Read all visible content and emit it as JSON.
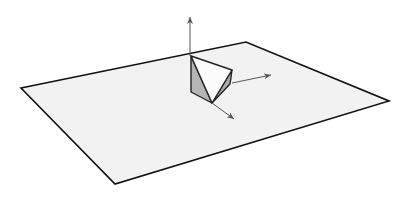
{
  "figure": {
    "colors": {
      "background": "#ffffff",
      "plane_fill": "#f2f2f2",
      "plane_edge": "#111111",
      "wedge_front_face": "#fbfbfb",
      "wedge_left_face": "#b5b5b5",
      "wedge_right_face": "#a9a9a9",
      "arrow": "#555555"
    },
    "plane": {
      "points": "21,88 246,42 389,101 115,184"
    },
    "wedge": {
      "left_face": "191,56 191,92 212,103",
      "front_face": "191,56 232,70 212,103",
      "right_face": "232,70 230,84 212,103"
    },
    "arrows": [
      {
        "name": "up-arrow",
        "x1": 190,
        "y1": 56,
        "x2": 190,
        "y2": 17
      },
      {
        "name": "right-arrow",
        "x1": 232,
        "y1": 83,
        "x2": 271,
        "y2": 75
      },
      {
        "name": "down-right-arrow",
        "x1": 212,
        "y1": 103,
        "x2": 234,
        "y2": 119
      }
    ]
  }
}
